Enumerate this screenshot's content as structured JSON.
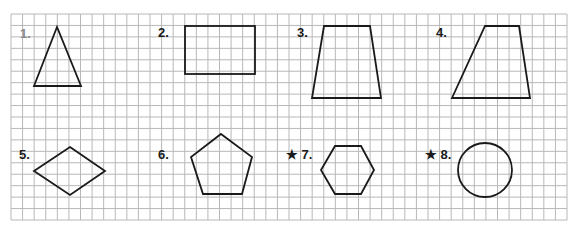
{
  "worksheet": {
    "grid": {
      "x": 11,
      "y": 14,
      "width": 556,
      "height": 206,
      "cell": 11.6,
      "line_color": "#b8b8b8",
      "stroke_color": "#1a1a1a"
    },
    "exercises": [
      {
        "number": "1.",
        "starred": false,
        "shape": "triangle"
      },
      {
        "number": "2.",
        "starred": false,
        "shape": "rectangle"
      },
      {
        "number": "3.",
        "starred": false,
        "shape": "trapezoid"
      },
      {
        "number": "4.",
        "starred": false,
        "shape": "trapezoid"
      },
      {
        "number": "5.",
        "starred": false,
        "shape": "rhombus"
      },
      {
        "number": "6.",
        "starred": false,
        "shape": "pentagon"
      },
      {
        "number": "★ 7.",
        "starred": true,
        "shape": "hexagon"
      },
      {
        "number": "★ 8.",
        "starred": true,
        "shape": "circle"
      }
    ]
  }
}
